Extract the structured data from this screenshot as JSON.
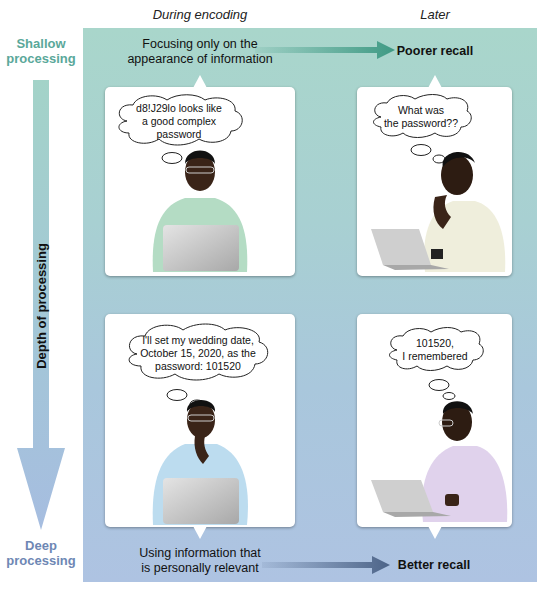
{
  "columns": {
    "encoding": "During encoding",
    "later": "Later"
  },
  "depth_axis": {
    "top_label_line1": "Shallow",
    "top_label_line2": "processing",
    "bottom_label_line1": "Deep",
    "bottom_label_line2": "processing",
    "axis_label": "Depth of processing",
    "top_color": "#5aa89a",
    "bottom_color": "#6e87b4"
  },
  "shallow_row": {
    "encoding_caption_line1": "Focusing only on the",
    "encoding_caption_line2": "appearance of information",
    "outcome": "Poorer recall",
    "arrow_color": "#3f9a84",
    "encoding_thought_line1": "d8!J29lo looks like",
    "encoding_thought_line2": "a good complex",
    "encoding_thought_line3": "password",
    "later_thought_line1": "What was",
    "later_thought_line2": "the password??",
    "encoding_sweater_color": "#b4dcc4",
    "later_sweater_color": "#efeedc"
  },
  "deep_row": {
    "encoding_caption_line1": "Using information that",
    "encoding_caption_line2": "is personally relevant",
    "outcome": "Better recall",
    "arrow_color": "#4d6488",
    "encoding_thought_line1": "I'll set my wedding date,",
    "encoding_thought_line2": "October 15, 2020, as the",
    "encoding_thought_line3": "password: 101520",
    "later_thought_line1": "101520,",
    "later_thought_line2": "I remembered",
    "encoding_sweater_color": "#bcdcef",
    "later_sweater_color": "#e0d2ec"
  }
}
